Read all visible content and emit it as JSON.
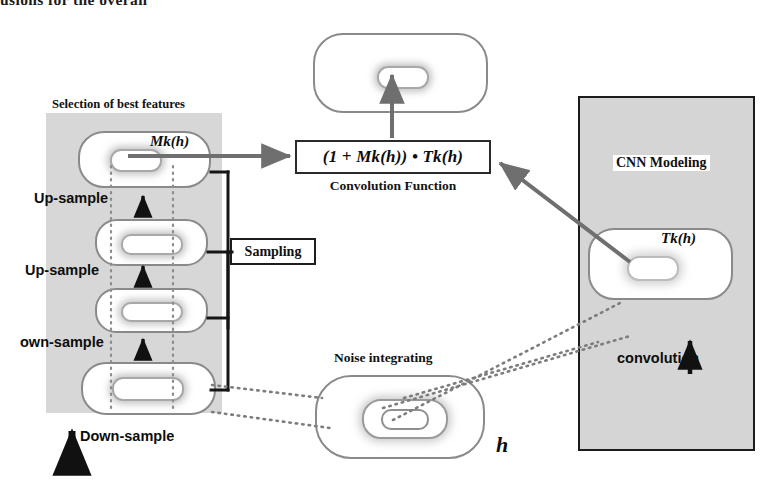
{
  "page": {
    "cropped_headline": "usions for the overall"
  },
  "left_panel": {
    "title": "Selection of best features",
    "capsules": [
      {
        "name": "mk-capsule",
        "label": "Mk(h)"
      },
      {
        "name": "upsample-2-capsule",
        "label": ""
      },
      {
        "name": "upsample-1-capsule",
        "label": ""
      },
      {
        "name": "down-capsule",
        "label": ""
      }
    ],
    "labels": {
      "upsample_top": "Up-sample",
      "upsample_mid": "Up-sample",
      "own_sample": "own-sample",
      "down_sample": "Down-sample"
    }
  },
  "sampling": {
    "label": "Sampling"
  },
  "center": {
    "formula": "(1 + Mk(h)) • Tk(h)",
    "formula_caption": "Convolution Function",
    "output_capsule_name": "output-feature-map"
  },
  "noise": {
    "label": "Noise integrating",
    "input_symbol": "h"
  },
  "right_panel": {
    "title": "CNN Modeling",
    "tk_label": "Tk(h)",
    "convolution_label": "convolution"
  },
  "colors": {
    "panel_gray": "#d6d6d6",
    "capsule_outline": "#8a8a8a",
    "arrow_gray": "#6f6f6f",
    "arrow_black": "#111111",
    "box_border": "#1d1d1d",
    "text": "#0d0d0d"
  }
}
